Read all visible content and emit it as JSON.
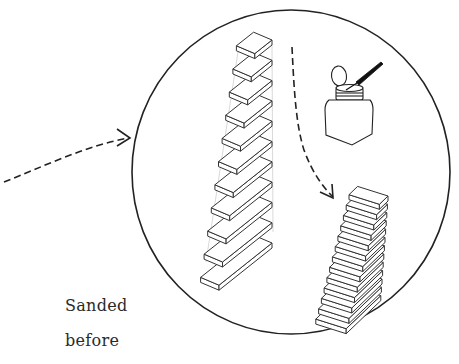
{
  "labels": {
    "line1": "Sanded",
    "line2": "before"
  },
  "colors": {
    "stroke": "#222222",
    "faint": "#bbbbbb",
    "background": "#ffffff"
  },
  "figure": {
    "magnifier_circle": {
      "cx": 291,
      "cy": 172,
      "rx": 159,
      "ry": 162
    },
    "tower_block_count": 11,
    "stair_step_count": 13,
    "elements": [
      "incoming-dashed-arrow",
      "magnifier-circle",
      "exploded-block-tower",
      "solvent-dispenser-bottle",
      "brush",
      "dashed-arrow-down",
      "stacked-staircase"
    ]
  }
}
